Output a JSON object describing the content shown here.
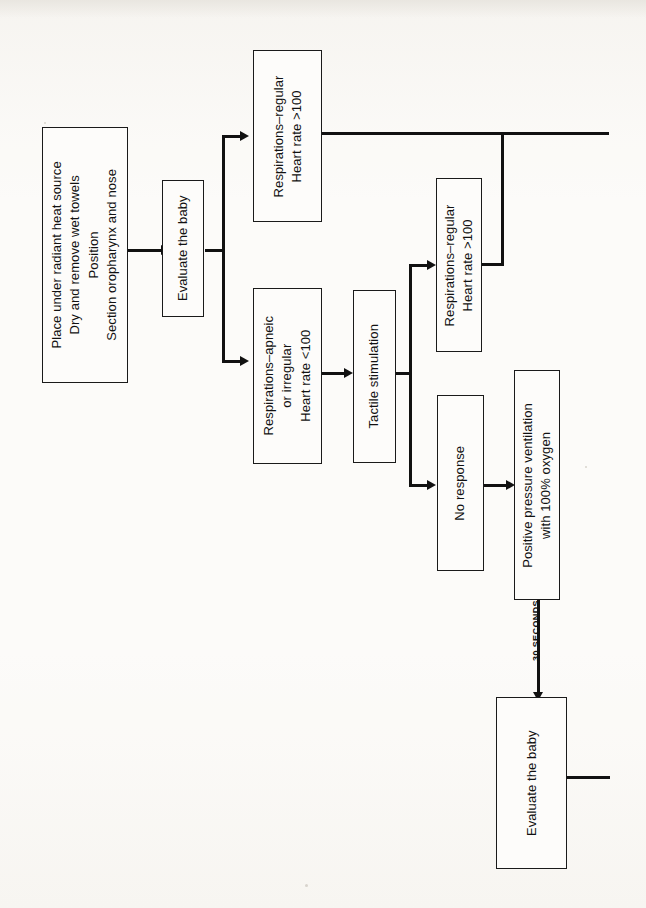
{
  "diagram": {
    "orientation": "rotated-90-ccw",
    "ink_color": "#111111",
    "paper_color": "#fbfaf7"
  },
  "nodes": {
    "initial_steps": {
      "id": "initial-steps",
      "lines": [
        "Place under radiant heat source",
        "Dry and remove wet towels",
        "Position",
        "Section oropharynx and nose"
      ]
    },
    "evaluate_1": {
      "id": "evaluate-baby-1",
      "lines": [
        "Evaluate the baby"
      ]
    },
    "resp_regular_1": {
      "id": "respirations-regular-1",
      "lines": [
        "Respirations–regular",
        "Heart rate >100"
      ]
    },
    "resp_apneic": {
      "id": "respirations-apneic",
      "lines": [
        "Respirations–apneic",
        "or irregular",
        "Heart rate <100"
      ]
    },
    "tactile": {
      "id": "tactile-stimulation",
      "lines": [
        "Tactile stimulation"
      ]
    },
    "resp_regular_2": {
      "id": "respirations-regular-2",
      "lines": [
        "Respirations–regular",
        "Heart rate >100"
      ]
    },
    "no_response": {
      "id": "no-response",
      "lines": [
        "No response"
      ]
    },
    "ppv": {
      "id": "positive-pressure-ventilation",
      "lines": [
        "Positive pressure ventilation",
        "with 100% oxygen"
      ]
    },
    "evaluate_2": {
      "id": "evaluate-baby-2",
      "lines": [
        "Evaluate the baby"
      ]
    }
  },
  "edges": {
    "timer_label": "30 SECONDS"
  }
}
